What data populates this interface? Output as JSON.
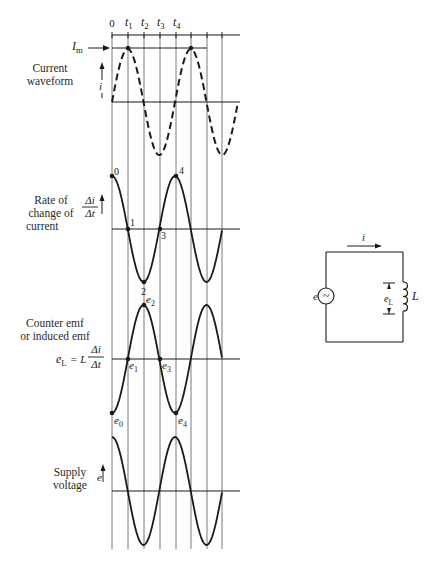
{
  "time_axis": {
    "labels": [
      "0",
      "t1",
      "t2",
      "t3",
      "t4"
    ],
    "gridlines_x": [
      112,
      128,
      144,
      160,
      176,
      191,
      207,
      222
    ]
  },
  "panels": [
    {
      "id": "current",
      "title_line1": "Current",
      "title_line2": "waveform",
      "axis_symbol": "i",
      "marker_label": "I",
      "marker_sub": "m",
      "style": "dashed",
      "shape": "sine"
    },
    {
      "id": "rate",
      "title_line1": "Rate of",
      "title_line2": "change of",
      "title_line3": "current",
      "axis_num": "Δi",
      "axis_den": "Δt",
      "point_labels": [
        "0",
        "1",
        "2",
        "3",
        "4"
      ],
      "style": "solid",
      "shape": "cosine"
    },
    {
      "id": "counter_emf",
      "title_line1": "Counter emf",
      "title_line2": "or induced emf",
      "formula_lhs": "e",
      "formula_lhs_sub": "L",
      "formula_eq": "= L",
      "formula_num": "Δi",
      "formula_den": "Δt",
      "point_labels": [
        "e0",
        "e1",
        "e2",
        "e3",
        "e4"
      ],
      "style": "solid",
      "shape": "negative-cosine"
    },
    {
      "id": "supply",
      "title_line1": "Supply",
      "title_line2": "voltage",
      "axis_symbol": "e",
      "style": "solid",
      "shape": "cosine"
    }
  ],
  "circuit": {
    "current_label": "i",
    "source_label": "e",
    "source_symbol": "~",
    "voltage_label": "e",
    "voltage_sub": "L",
    "inductor_label": "L"
  },
  "colors": {
    "ink": "#1a1a1a",
    "grid": "#555555",
    "background": "#ffffff"
  }
}
